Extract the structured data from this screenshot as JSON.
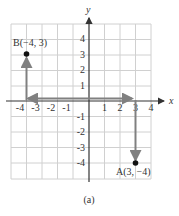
{
  "figure": {
    "caption": "(a)",
    "axes": {
      "x_label": "x",
      "y_label": "y",
      "x_range": [
        -4,
        4
      ],
      "y_range": [
        -4,
        4
      ],
      "x_ticks": [
        "-4",
        "-3",
        "-2",
        "-1",
        "1",
        "2",
        "3",
        "4"
      ],
      "y_ticks": [
        "4",
        "3",
        "2",
        "1",
        "-1",
        "-2",
        "-3",
        "-4"
      ],
      "grid": true
    },
    "points": [
      {
        "name": "B",
        "label": "B(−4, 3)",
        "x": -4,
        "y": 3
      },
      {
        "name": "A",
        "label": "A(3, −4)",
        "x": 3,
        "y": -4
      }
    ],
    "arrows": [
      {
        "from": [
          0,
          0
        ],
        "to": [
          -4,
          0
        ],
        "description": "horizontal move left 4"
      },
      {
        "from": [
          -4,
          0
        ],
        "to": [
          -4,
          3
        ],
        "description": "vertical move up 3"
      },
      {
        "from": [
          0,
          0
        ],
        "to": [
          3,
          0
        ],
        "description": "horizontal move right 3"
      },
      {
        "from": [
          3,
          0
        ],
        "to": [
          3,
          -4
        ],
        "description": "vertical move down 4"
      }
    ],
    "colors": {
      "grid": "#d0d0d0",
      "axis": "#333333",
      "arrow": "#808080",
      "point": "#111111"
    }
  }
}
